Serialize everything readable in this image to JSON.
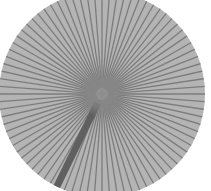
{
  "figure": {
    "shape": "radial-burst-disc",
    "center": [
      102,
      94
    ],
    "radius": 103,
    "ray_count": 84,
    "colors": {
      "background": "#ffffff",
      "disc_fill": "#b4b4b4",
      "ray_stroke": "#7c7c7c",
      "center_glow": "#8a8a8a",
      "highlight_ray": "#606060"
    },
    "highlight_ray": {
      "angle_deg": 116,
      "width_px": 7
    }
  }
}
